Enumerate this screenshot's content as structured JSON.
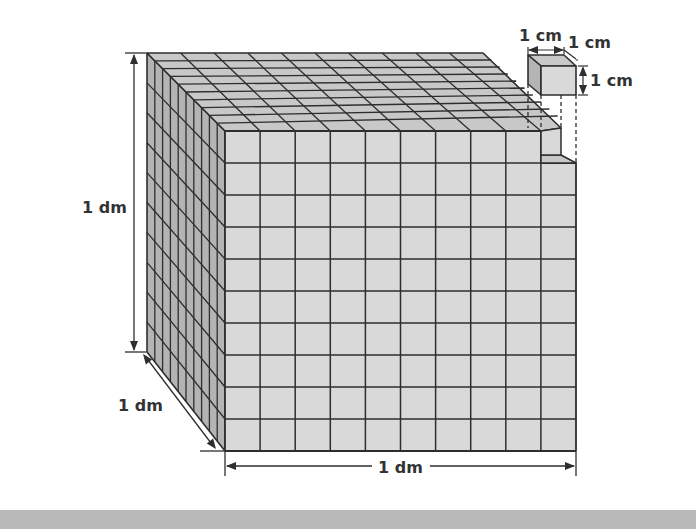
{
  "diagram": {
    "labels": {
      "height": "1 dm",
      "depth": "1 dm",
      "width": "1 dm",
      "small_cube_width": "1 cm",
      "small_cube_depth": "1 cm",
      "small_cube_height": "1 cm"
    },
    "grid": {
      "columns": 10,
      "rows": 10,
      "layers": 10
    },
    "colors": {
      "front_face": "#d9d9d9",
      "top_face": "#c8c8c8",
      "side_face": "#b4b4b4",
      "line": "#2e2e2e",
      "band": "#b9b9b9"
    }
  }
}
